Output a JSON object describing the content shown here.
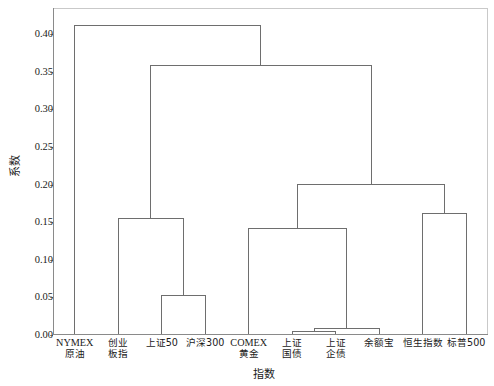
{
  "chart_data": {
    "type": "dendrogram",
    "title": "",
    "xlabel": "指数",
    "ylabel": "系数",
    "ylim": [
      0.0,
      0.435
    ],
    "yticks": [
      0.0,
      0.05,
      0.1,
      0.15,
      0.2,
      0.25,
      0.3,
      0.35,
      0.4
    ],
    "ytick_labels": [
      "0.00",
      "0.05",
      "0.10",
      "0.15",
      "0.20",
      "0.25",
      "0.30",
      "0.35",
      "0.40"
    ],
    "grid": false,
    "legend": null,
    "orientation": "vertical",
    "line_color": "#6e6e6e",
    "background_color": "#ffffff",
    "leaves": [
      {
        "id": "nymex",
        "line1": "NYMEX",
        "line2": "原油",
        "position": 1
      },
      {
        "id": "chinext",
        "line1": "创业",
        "line2": "板指",
        "position": 2
      },
      {
        "id": "sse50",
        "line1": "上证50",
        "line2": "",
        "position": 3
      },
      {
        "id": "csi300",
        "line1": "沪深300",
        "line2": "",
        "position": 4
      },
      {
        "id": "comex",
        "line1": "COMEX",
        "line2": "黄金",
        "position": 5
      },
      {
        "id": "sse-treasury",
        "line1": "上证",
        "line2": "国债",
        "position": 6
      },
      {
        "id": "sse-corp",
        "line1": "上证",
        "line2": "企债",
        "position": 7
      },
      {
        "id": "yuebao",
        "line1": "余额宝",
        "line2": "",
        "position": 8
      },
      {
        "id": "hangseng",
        "line1": "恒生指数",
        "line2": "",
        "position": 9
      },
      {
        "id": "sp500",
        "line1": "标普500",
        "line2": "",
        "position": 10
      }
    ],
    "merges": [
      {
        "id": "m1",
        "left": "sse-treasury",
        "right": "sse-corp",
        "height": 0.005
      },
      {
        "id": "m2",
        "left": "m1",
        "right": "yuebao",
        "height": 0.008
      },
      {
        "id": "m3",
        "left": "sse50",
        "right": "csi300",
        "height": 0.053
      },
      {
        "id": "m4",
        "left": "comex",
        "right": "m2",
        "height": 0.142
      },
      {
        "id": "m5",
        "left": "chinext",
        "right": "m3",
        "height": 0.155
      },
      {
        "id": "m6",
        "left": "hangseng",
        "right": "sp500",
        "height": 0.161
      },
      {
        "id": "m7",
        "left": "m4",
        "right": "m6",
        "height": 0.2
      },
      {
        "id": "m8",
        "left": "m5",
        "right": "m7",
        "height": 0.358
      },
      {
        "id": "m9",
        "left": "nymex",
        "right": "m8",
        "height": 0.412
      }
    ]
  }
}
